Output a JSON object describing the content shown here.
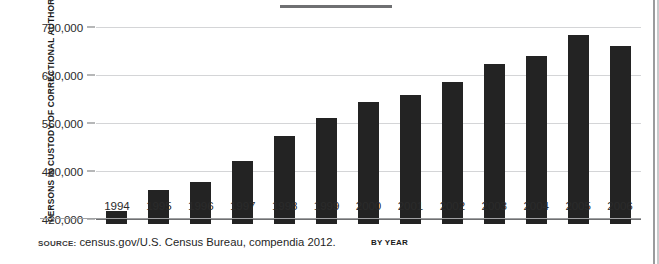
{
  "chart_data": {
    "type": "bar",
    "title": "",
    "xlabel": "BY YEAR",
    "ylabel": "PERSONS IN CUSTODY OF CORRECTIONAL AUTHORITIES",
    "categories": [
      "1994",
      "1995",
      "1996",
      "1997",
      "1998",
      "1999",
      "2000",
      "2001",
      "2002",
      "2003",
      "2004",
      "2005",
      "2006"
    ],
    "values": [
      431700,
      462000,
      474000,
      504600,
      541000,
      567300,
      590600,
      600800,
      620000,
      646000,
      658000,
      688000,
      672000
    ],
    "ylim": [
      420000,
      700000
    ],
    "yticks": [
      420000,
      490000,
      560000,
      630000,
      700000
    ],
    "ytick_labels": [
      "420,000",
      "490,000",
      "560,000",
      "630,000",
      "700,000"
    ],
    "grid": true,
    "legend": false,
    "bar_color": "#232323",
    "gridline_color": "#d4d5d7",
    "axis_color": "#6f7072"
  },
  "footer": {
    "source_label": "SOURCE:",
    "source_text": "census.gov/U.S. Census Bureau, compendia 2012."
  }
}
